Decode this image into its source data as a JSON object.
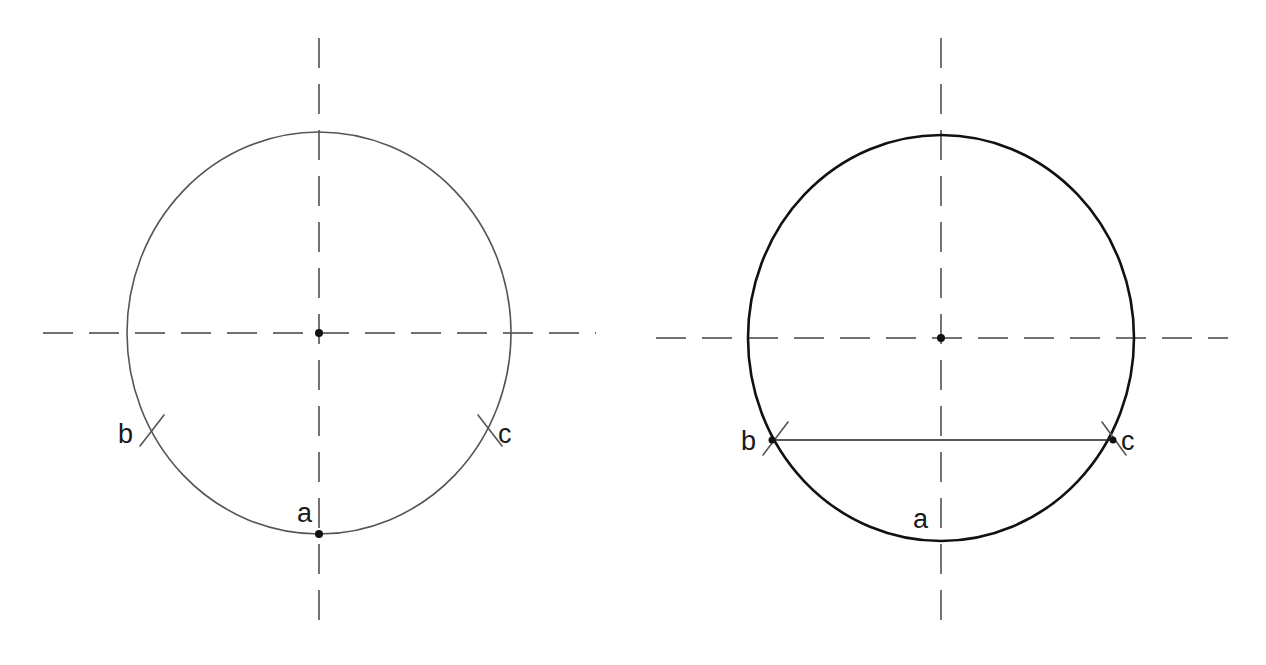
{
  "page": {
    "background_color": "#ffffff",
    "width": 1266,
    "height": 665
  },
  "style": {
    "construction_line_color": "#555555",
    "object_line_color": "#111111",
    "centerline_color": "#444444",
    "label_color": "#1a1a1a",
    "chord_color": "#222222",
    "construction_stroke_width": 1.6,
    "object_stroke_width": 2.6,
    "centerline_stroke_width": 1.5,
    "centerline_dash": "30 16"
  },
  "figures": [
    {
      "id": "left-figure",
      "name": "construction-step-circle",
      "circle": {
        "cx": 319,
        "cy": 333,
        "rx": 192,
        "ry": 201,
        "stroke": "#555555",
        "stroke_width": 1.6
      },
      "center_mark": {
        "cx": 319,
        "cy": 333,
        "r": 4
      },
      "vertical_centerline": {
        "x": 319,
        "y1": 38,
        "y2": 628
      },
      "horizontal_centerline": {
        "y": 333,
        "x1": 43,
        "x2": 596
      },
      "points": [
        {
          "id": "a",
          "label": "a",
          "x": 319,
          "y": 534,
          "has_dot": true,
          "dot_radius": 4,
          "label_x": 297,
          "label_y": 522,
          "tick": null
        },
        {
          "id": "b",
          "label": "b",
          "x": 151,
          "y": 433,
          "has_dot": false,
          "label_x": 118,
          "label_y": 443,
          "tick": {
            "x1": 140,
            "y1": 446,
            "x2": 164,
            "y2": 415
          }
        },
        {
          "id": "c",
          "label": "c",
          "x": 489,
          "y": 433,
          "has_dot": false,
          "label_x": 498,
          "label_y": 443,
          "tick": {
            "x1": 478,
            "y1": 415,
            "x2": 502,
            "y2": 446
          }
        }
      ],
      "chord": null
    },
    {
      "id": "right-figure",
      "name": "finished-circle-with-chord",
      "circle": {
        "cx": 941,
        "cy": 338,
        "rx": 193,
        "ry": 203,
        "stroke": "#111111",
        "stroke_width": 2.6
      },
      "center_mark": {
        "cx": 941,
        "cy": 338,
        "r": 4
      },
      "vertical_centerline": {
        "x": 941,
        "y1": 38,
        "y2": 628
      },
      "horizontal_centerline": {
        "y": 338,
        "x1": 656,
        "x2": 1228
      },
      "points": [
        {
          "id": "a",
          "label": "a",
          "x": 941,
          "y": 541,
          "has_dot": false,
          "label_x": 913,
          "label_y": 528,
          "tick": null
        },
        {
          "id": "b",
          "label": "b",
          "x": 772,
          "y": 440,
          "has_dot": false,
          "label_x": 741,
          "label_y": 450,
          "tick": {
            "x1": 763,
            "y1": 455,
            "x2": 788,
            "y2": 422
          }
        },
        {
          "id": "c",
          "label": "c",
          "x": 1113,
          "y": 440,
          "has_dot": false,
          "label_x": 1121,
          "label_y": 450,
          "tick": {
            "x1": 1102,
            "y1": 422,
            "x2": 1126,
            "y2": 455
          }
        }
      ],
      "chord": {
        "name": "chord-b-to-c",
        "x1": 772,
        "y1": 440,
        "x2": 1113,
        "y2": 440,
        "stroke": "#222222",
        "stroke_width": 1.7,
        "endpoint_dot_radius": 3.5
      }
    }
  ]
}
